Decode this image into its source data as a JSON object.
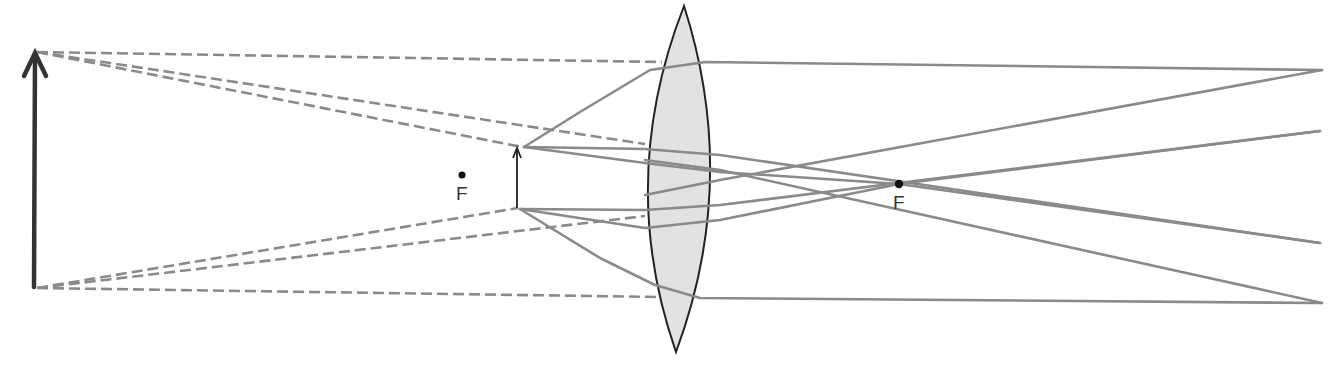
{
  "diagram": {
    "colors": {
      "background": "#ffffff",
      "lens_fill": "#e2e2e2",
      "lens_stroke": "#222222",
      "ray": "#8a8a8a",
      "arrow": "#333333",
      "focal_point": "#111111"
    },
    "lens": {
      "type": "biconvex",
      "center_x": 678,
      "top_y": 6,
      "bottom_y": 352,
      "half_width": 40
    },
    "object": {
      "kind": "large-arrow",
      "x": 35,
      "base_y": 287,
      "tip_y": 52
    },
    "image": {
      "kind": "small-arrow",
      "x": 517,
      "base_y": 208,
      "tip_y": 148
    },
    "focal_points": [
      {
        "label": "F",
        "x": 462,
        "y": 175,
        "side": "left"
      },
      {
        "label": "F",
        "x": 899,
        "y": 184,
        "side": "right"
      }
    ],
    "virtual_rays": [
      {
        "from": [
          35,
          52
        ],
        "to": [
          662,
          62
        ]
      },
      {
        "from": [
          35,
          52
        ],
        "to": [
          525,
          147
        ]
      },
      {
        "from": [
          35,
          52
        ],
        "to": [
          645,
          143
        ]
      },
      {
        "from": [
          35,
          287
        ],
        "to": [
          515,
          209
        ]
      },
      {
        "from": [
          35,
          287
        ],
        "to": [
          645,
          216
        ]
      },
      {
        "from": [
          35,
          287
        ],
        "to": [
          660,
          297
        ]
      }
    ],
    "real_rays": [
      {
        "points": [
          [
            525,
            147
          ],
          [
            650,
            70
          ],
          [
            700,
            62
          ],
          [
            1320,
            70
          ]
        ]
      },
      {
        "points": [
          [
            525,
            147
          ],
          [
            640,
            148
          ],
          [
            758,
            156
          ],
          [
            1320,
            243
          ]
        ]
      },
      {
        "points": [
          [
            525,
            147
          ],
          [
            640,
            162
          ],
          [
            899,
            184
          ],
          [
            1320,
            131
          ]
        ]
      },
      {
        "points": [
          [
            520,
            209
          ],
          [
            640,
            228
          ],
          [
            899,
            184
          ],
          [
            1320,
            243
          ]
        ]
      },
      {
        "points": [
          [
            520,
            209
          ],
          [
            640,
            210
          ],
          [
            758,
            207
          ],
          [
            1320,
            131
          ]
        ]
      },
      {
        "points": [
          [
            520,
            209
          ],
          [
            650,
            285
          ],
          [
            700,
            298
          ],
          [
            1320,
            303
          ]
        ]
      },
      {
        "points": [
          [
            700,
            298
          ],
          [
            1320,
            303
          ]
        ]
      },
      {
        "points": [
          [
            1320,
            303
          ],
          [
            700,
            180
          ]
        ]
      },
      {
        "points": [
          [
            700,
            62
          ],
          [
            1320,
            70
          ]
        ]
      },
      {
        "points": [
          [
            1320,
            70
          ],
          [
            700,
            180
          ]
        ]
      }
    ]
  }
}
